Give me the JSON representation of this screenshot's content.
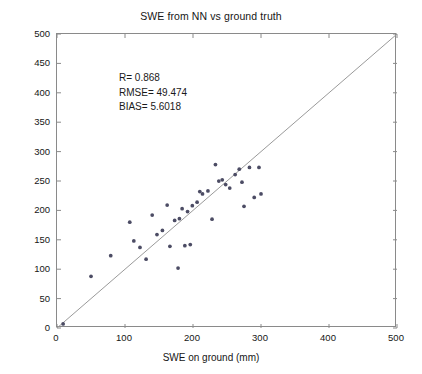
{
  "chart_data": {
    "type": "scatter",
    "title": "SWE from NN vs ground truth",
    "xlabel": "SWE on ground (mm)",
    "ylabel": "SWE NN (mm)",
    "xlim": [
      0,
      500
    ],
    "ylim": [
      0,
      500
    ],
    "xticks": [
      0,
      100,
      200,
      300,
      400,
      500
    ],
    "yticks": [
      0,
      50,
      100,
      150,
      200,
      250,
      300,
      350,
      400,
      450,
      500
    ],
    "grid": false,
    "legend": null,
    "marker": "dot",
    "marker_color": "#4c4c64",
    "marker_size": 3,
    "reference_line": {
      "name": "one-to-one-line",
      "from": [
        0,
        0
      ],
      "to": [
        500,
        500
      ],
      "color": "#9a9a9a",
      "width": 1
    },
    "series": [
      {
        "name": "SWE NN vs ground",
        "points": [
          [
            9,
            7
          ],
          [
            50,
            88
          ],
          [
            79,
            123
          ],
          [
            107,
            180
          ],
          [
            113,
            148
          ],
          [
            122,
            137
          ],
          [
            131,
            117
          ],
          [
            140,
            192
          ],
          [
            147,
            159
          ],
          [
            155,
            166
          ],
          [
            162,
            209
          ],
          [
            166,
            139
          ],
          [
            173,
            183
          ],
          [
            178,
            102
          ],
          [
            180,
            186
          ],
          [
            184,
            203
          ],
          [
            188,
            140
          ],
          [
            192,
            198
          ],
          [
            196,
            142
          ],
          [
            199,
            208
          ],
          [
            206,
            214
          ],
          [
            210,
            232
          ],
          [
            214,
            228
          ],
          [
            222,
            233
          ],
          [
            228,
            185
          ],
          [
            233,
            278
          ],
          [
            238,
            250
          ],
          [
            243,
            252
          ],
          [
            248,
            244
          ],
          [
            254,
            238
          ],
          [
            262,
            261
          ],
          [
            268,
            270
          ],
          [
            272,
            248
          ],
          [
            275,
            207
          ],
          [
            283,
            273
          ],
          [
            290,
            222
          ],
          [
            297,
            273
          ],
          [
            300,
            228
          ]
        ]
      }
    ],
    "annotations": [
      {
        "name": "r-value",
        "text": "R= 0.868"
      },
      {
        "name": "rmse-value",
        "text": "RMSE= 49.474"
      },
      {
        "name": "bias-value",
        "text": "BIAS= 5.6018"
      }
    ]
  },
  "stats": {
    "r": "R= 0.868",
    "rmse": "RMSE= 49.474",
    "bias": "BIAS= 5.6018"
  }
}
